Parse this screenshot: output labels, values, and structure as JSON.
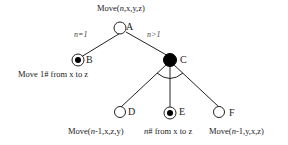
{
  "diagram": {
    "type": "and-or-tree",
    "title": "Move(n,x,y,z)",
    "nodes": [
      {
        "id": "A",
        "label": "A",
        "style": "open",
        "caption": "Move(n,x,y,z)"
      },
      {
        "id": "B",
        "label": "B",
        "style": "terminal",
        "caption": "Move 1# from x to z"
      },
      {
        "id": "C",
        "label": "C",
        "style": "filled-and",
        "caption": ""
      },
      {
        "id": "D",
        "label": "D",
        "style": "open",
        "caption": "Move(n-1,x,z,y)"
      },
      {
        "id": "E",
        "label": "E",
        "style": "terminal",
        "caption": "n# from x to z"
      },
      {
        "id": "F",
        "label": "F",
        "style": "open",
        "caption": "Move(n-1,y,x,z)"
      }
    ],
    "edges": [
      {
        "from": "A",
        "to": "B",
        "label": "n=1"
      },
      {
        "from": "A",
        "to": "C",
        "label": "n>1"
      },
      {
        "from": "C",
        "to": "D",
        "label": ""
      },
      {
        "from": "C",
        "to": "E",
        "label": ""
      },
      {
        "from": "C",
        "to": "F",
        "label": ""
      }
    ],
    "colors": {
      "line": "#222222",
      "fill": "#000000",
      "background": "#ffffff"
    }
  }
}
